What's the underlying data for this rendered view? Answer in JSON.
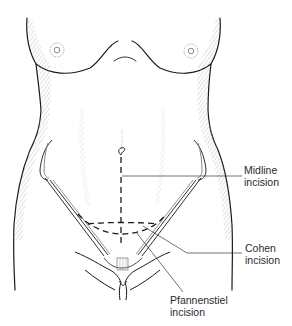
{
  "figure": {
    "labels": {
      "midline": {
        "line1": "Midline",
        "line2": "incision"
      },
      "cohen": {
        "line1": "Cohen",
        "line2": "incision"
      },
      "pfannenstiel": {
        "line1": "Pfannenstiel",
        "line2": "incision"
      }
    },
    "colors": {
      "outline": "#1a1a1a",
      "hatch": "#9a9a9a",
      "leader": "#333333",
      "text": "#2a2a2a",
      "background": "#ffffff"
    }
  }
}
